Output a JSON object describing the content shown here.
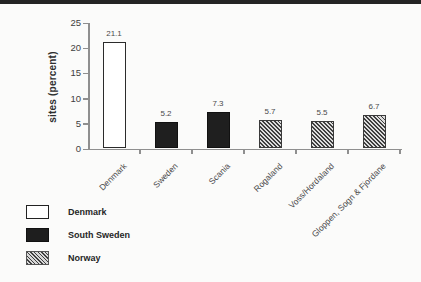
{
  "chart_data": {
    "type": "bar",
    "title": "",
    "xlabel": "",
    "ylabel": "sites (percent)",
    "ylim": [
      0,
      25
    ],
    "yticks": [
      0,
      5,
      10,
      15,
      20,
      25
    ],
    "grid": false,
    "categories": [
      "Denmark",
      "Sweden",
      "Scania",
      "Rogaland",
      "Voss/Hordaland",
      "Gloppen, Sogn & Fjordane"
    ],
    "values": [
      21.1,
      5.2,
      7.3,
      5.7,
      5.5,
      6.7
    ],
    "value_labels": [
      "21.1",
      "5.2",
      "7.3",
      "5.7",
      "5.5",
      "6.7"
    ],
    "bar_styles": [
      "white",
      "black",
      "black",
      "hatched",
      "hatched",
      "hatched"
    ],
    "legend_position": "bottom-left",
    "legend": [
      {
        "label": "Denmark",
        "style": "white"
      },
      {
        "label": "South Sweden",
        "style": "black"
      },
      {
        "label": "Norway",
        "style": "hatched"
      }
    ]
  },
  "colors": {
    "background": "#fbfbfa",
    "top_band": "#242424",
    "axis": "#8f8f8f",
    "bar_black": "#1f1f1f",
    "bar_outline": "#2b2b2b",
    "text": "#3e3e3e"
  }
}
